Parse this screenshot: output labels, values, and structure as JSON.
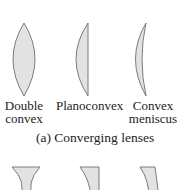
{
  "figure": {
    "converging": {
      "caption": "(a) Converging lenses",
      "lenses": [
        {
          "name": "double-convex",
          "label_line1": "Double",
          "label_line2": "convex"
        },
        {
          "name": "planoconvex",
          "label_line1": "Planoconvex",
          "label_line2": ""
        },
        {
          "name": "convex-meniscus",
          "label_line1": "Convex",
          "label_line2": "meniscus"
        }
      ]
    },
    "diverging": {
      "lenses": [
        {
          "name": "double-concave"
        },
        {
          "name": "planoconcave"
        },
        {
          "name": "concave-meniscus"
        }
      ]
    },
    "colors": {
      "lens_fill": "#e2e2e2",
      "lens_stroke": "#7a7a7a"
    }
  }
}
